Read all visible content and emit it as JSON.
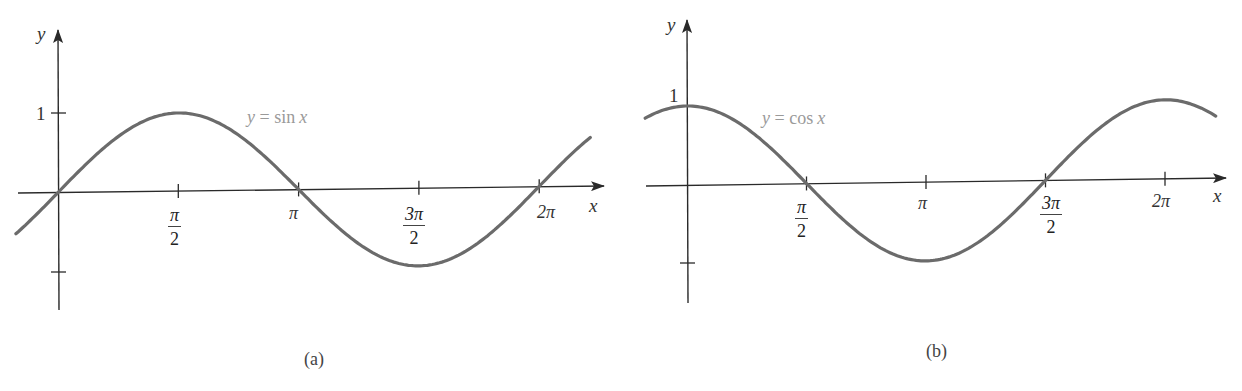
{
  "figure": {
    "panels": [
      {
        "id": "a",
        "caption": "(a)",
        "curve_label": "y = sin x",
        "curve_label_parts": {
          "lhs": "y",
          "eq": "=",
          "fn": "sin",
          "var": "x"
        },
        "x_axis_label": "x",
        "y_axis_label": "y",
        "y_tick_label": "1",
        "x_ticks": [
          {
            "num": "π",
            "den": "2"
          },
          {
            "label": "π"
          },
          {
            "num": "3π",
            "den": "2"
          },
          {
            "label": "2π"
          }
        ]
      },
      {
        "id": "b",
        "caption": "(b)",
        "curve_label": "y = cos x",
        "curve_label_parts": {
          "lhs": "y",
          "eq": "=",
          "fn": "cos",
          "var": "x"
        },
        "x_axis_label": "x",
        "y_axis_label": "y",
        "y_tick_label": "1",
        "x_ticks": [
          {
            "num": "π",
            "den": "2"
          },
          {
            "label": "π"
          },
          {
            "num": "3π",
            "den": "2"
          },
          {
            "label": "2π"
          }
        ]
      }
    ],
    "colors": {
      "curve": "#6b6b6b",
      "axis": "#2a2a2a",
      "label": "#9a9a9a"
    }
  },
  "chart_data": [
    {
      "type": "line",
      "title": "(a)",
      "series": [
        {
          "name": "y = sin x",
          "function": "sin"
        }
      ],
      "xlabel": "x",
      "ylabel": "y",
      "x_tick_labels": [
        "π/2",
        "π",
        "3π/2",
        "2π"
      ],
      "x_ticks": [
        1.5708,
        3.1416,
        4.7124,
        6.2832
      ],
      "y_tick_labels": [
        "1"
      ],
      "y_ticks": [
        1,
        -1
      ],
      "xlim": [
        -0.55,
        6.95
      ],
      "ylim": [
        -1.5,
        2.0
      ],
      "x": [
        -0.55,
        0,
        0.7854,
        1.5708,
        2.3562,
        3.1416,
        3.927,
        4.7124,
        5.4978,
        6.2832,
        6.95
      ],
      "values": [
        -0.52,
        0,
        0.707,
        1,
        0.707,
        0,
        -0.707,
        -1,
        -0.707,
        0,
        0.61
      ],
      "grid": false,
      "legend": "inline label near curve"
    },
    {
      "type": "line",
      "title": "(b)",
      "series": [
        {
          "name": "y = cos x",
          "function": "cos"
        }
      ],
      "xlabel": "x",
      "ylabel": "y",
      "x_tick_labels": [
        "π/2",
        "π",
        "3π/2",
        "2π"
      ],
      "x_ticks": [
        1.5708,
        3.1416,
        4.7124,
        6.2832
      ],
      "y_tick_labels": [
        "1"
      ],
      "y_ticks": [
        1,
        -1
      ],
      "xlim": [
        -0.55,
        6.95
      ],
      "ylim": [
        -1.5,
        2.0
      ],
      "x": [
        -0.55,
        0,
        0.7854,
        1.5708,
        2.3562,
        3.1416,
        3.927,
        4.7124,
        5.4978,
        6.2832,
        6.95
      ],
      "values": [
        0.85,
        1,
        0.707,
        0,
        -0.707,
        -1,
        -0.707,
        0,
        0.707,
        1,
        0.78
      ],
      "grid": false,
      "legend": "inline label near curve"
    }
  ]
}
